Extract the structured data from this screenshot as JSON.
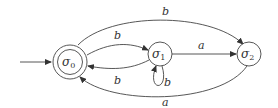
{
  "diagram": {
    "type": "finite-automaton",
    "states": [
      {
        "id": "s0",
        "label": "σ",
        "subscript": "0",
        "accepting": true,
        "initial": true
      },
      {
        "id": "s1",
        "label": "σ",
        "subscript": "1",
        "accepting": false,
        "initial": false
      },
      {
        "id": "s2",
        "label": "σ",
        "subscript": "2",
        "accepting": false,
        "initial": false
      }
    ],
    "transitions": [
      {
        "from": "s0",
        "to": "s2",
        "label": "b"
      },
      {
        "from": "s0",
        "to": "s1",
        "label": "b"
      },
      {
        "from": "s1",
        "to": "s0",
        "label": "b"
      },
      {
        "from": "s1",
        "to": "s1",
        "label": "b"
      },
      {
        "from": "s1",
        "to": "s2",
        "label": "a"
      },
      {
        "from": "s2",
        "to": "s0",
        "label": "a"
      }
    ],
    "colors": {
      "stroke": "#444444",
      "text": "#333333",
      "background": "#ffffff"
    }
  }
}
